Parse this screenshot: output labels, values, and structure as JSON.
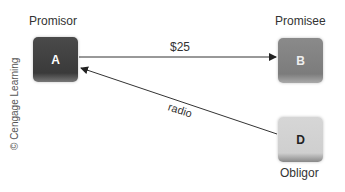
{
  "nodes": {
    "a": {
      "letter": "A",
      "role": "Promisor"
    },
    "b": {
      "letter": "B",
      "role": "Promisee"
    },
    "d": {
      "letter": "D",
      "role": "Obligor"
    }
  },
  "edges": [
    {
      "from": "A",
      "to": "B",
      "label": "$25"
    },
    {
      "from": "D",
      "to": "A",
      "label": "radio"
    }
  ],
  "credit": "© Cengage Learning"
}
